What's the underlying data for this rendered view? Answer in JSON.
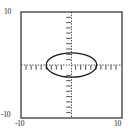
{
  "chart_data": {
    "type": "line",
    "title": "",
    "xlabel": "",
    "ylabel": "",
    "xlim": [
      -10,
      10
    ],
    "ylim": [
      -10,
      10
    ],
    "grid": false,
    "axes_style": "dotted-crosshair-with-ticks",
    "frame": true,
    "legend": null,
    "x_tick_labels": [
      "-10",
      "10"
    ],
    "y_tick_labels": [
      "-10",
      "10"
    ],
    "x_tick_label_values": [
      -10,
      10
    ],
    "y_tick_label_values": [
      -10,
      10
    ],
    "minor_tick_interval": 1,
    "series": [
      {
        "name": "ellipse",
        "shape": "ellipse",
        "center": [
          0,
          0
        ],
        "semi_axis_x": 5.0,
        "semi_axis_y": 2.3,
        "equation": "x^2/25 + y^2/5.29 = 1",
        "color": "#1a1a1a",
        "linewidth": 1.2,
        "fill": "none"
      }
    ]
  },
  "colors": {
    "frame": "#3a3a3a",
    "axis": "#4a4a4a",
    "curve": "#1a1a1a",
    "background": "#ffffff",
    "text": "#1a1a1a"
  },
  "labels": {
    "y_max": "10",
    "y_min": "-10",
    "x_min": "-10",
    "x_max": "10"
  }
}
